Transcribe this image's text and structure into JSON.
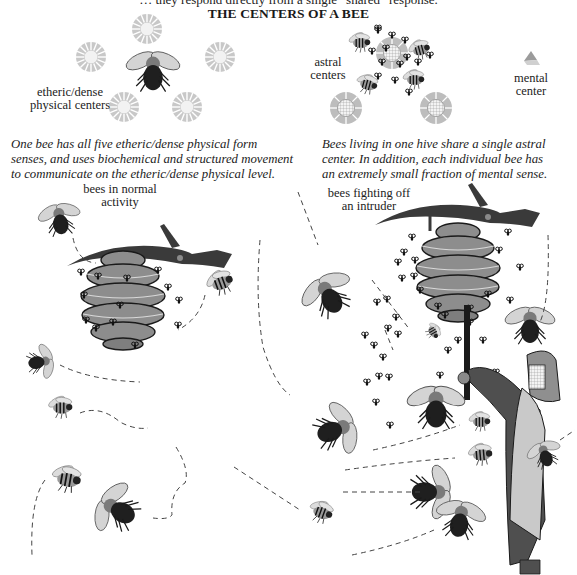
{
  "header": {
    "cut_off_line": "… they respond directly from a single “shared” response.",
    "title": "THE CENTERS OF A BEE"
  },
  "top_left_panel": {
    "label": "etheric/dense physical centers",
    "label_lines": [
      "etheric/dense",
      "physical centers"
    ],
    "center_count": 5,
    "caption_lines": [
      "One bee has all five etheric/dense physical form",
      "senses, and uses biochemical and structured movement",
      "to communicate on the etheric/dense physical level."
    ]
  },
  "top_right_panel": {
    "astral_label_lines": [
      "astral",
      "centers"
    ],
    "mental_label_lines": [
      "mental",
      "center"
    ],
    "caption_lines": [
      "Bees living in one hive share a single astral",
      "center. In addition, each individual bee has",
      "an extremely small fraction of mental sense."
    ]
  },
  "bottom_left_scene": {
    "label_lines": [
      "bees in normal",
      "activity"
    ]
  },
  "bottom_right_scene": {
    "label_lines": [
      "bees fighting off",
      "an intruder"
    ]
  },
  "colors": {
    "ink": "#1a1a1a",
    "hive_gray": "#8a8a8a",
    "hive_dark": "#2a2a2a",
    "center_gray": "#b5b5b5",
    "coat_gray": "#4f4f4f",
    "apron_gray": "#c9c9c9"
  }
}
